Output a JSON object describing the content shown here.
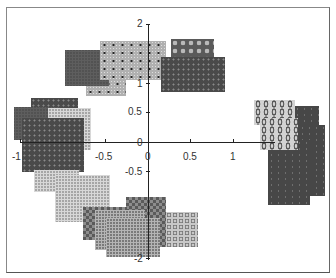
{
  "chart_data": {
    "type": "scatter",
    "title": "",
    "xlabel": "",
    "ylabel": "",
    "x_ticks": [
      "-1",
      "-0.5",
      "0",
      "0.5",
      "1"
    ],
    "y_ticks": [
      "2",
      "1",
      "0.5",
      "0",
      "-0.5",
      "-2"
    ],
    "xlim": [
      -1,
      1.5
    ],
    "ylim": [
      -2,
      2
    ],
    "grid": false,
    "legend": null,
    "clusters": [
      {
        "name": "top",
        "points": [
          [
            -0.6,
            1.45
          ],
          [
            -0.3,
            1.3
          ],
          [
            -0.1,
            1.55
          ],
          [
            0.45,
            1.55
          ],
          [
            0.45,
            1.25
          ]
        ]
      },
      {
        "name": "left",
        "points": [
          [
            -1.0,
            0.6
          ],
          [
            -1.1,
            0.45
          ],
          [
            -0.75,
            0.4
          ],
          [
            -0.95,
            0.1
          ]
        ]
      },
      {
        "name": "bottom",
        "points": [
          [
            -0.9,
            -0.55
          ],
          [
            -0.65,
            -0.75
          ],
          [
            -0.4,
            -1.25
          ],
          [
            0.05,
            -1.3
          ],
          [
            -0.15,
            -1.45
          ],
          [
            -0.05,
            -1.55
          ],
          [
            0.35,
            -1.45
          ]
        ]
      },
      {
        "name": "right",
        "points": [
          [
            1.3,
            0.45
          ],
          [
            1.55,
            0.4
          ],
          [
            1.5,
            -0.15
          ],
          [
            1.4,
            -0.3
          ]
        ]
      }
    ]
  },
  "axes": {
    "x_labels": [
      {
        "text": "-1",
        "left": 12,
        "top": 152
      },
      {
        "text": "-0.5",
        "left": 95,
        "top": 152
      },
      {
        "text": "0",
        "left": 145,
        "top": 152
      },
      {
        "text": "0.5",
        "left": 183,
        "top": 152
      },
      {
        "text": "1",
        "left": 230,
        "top": 152
      }
    ],
    "y_labels": [
      {
        "text": "2",
        "left": 137,
        "top": 19
      },
      {
        "text": "1",
        "left": 137,
        "top": 79
      },
      {
        "text": "0.5",
        "left": 128,
        "top": 107
      },
      {
        "text": "0",
        "left": 137,
        "top": 138
      },
      {
        "text": "-0.5",
        "left": 125,
        "top": 167
      },
      {
        "text": "-2",
        "left": 134,
        "top": 254
      }
    ]
  }
}
